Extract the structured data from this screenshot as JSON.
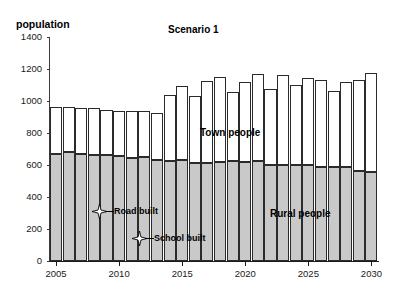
{
  "chart_data": {
    "type": "bar",
    "stacked": true,
    "title": "Scenario 1",
    "xlabel": "",
    "ylabel": "population",
    "ylim": [
      0,
      1400
    ],
    "yticks": [
      0,
      200,
      400,
      600,
      800,
      1000,
      1200,
      1400
    ],
    "xticks": [
      "2005",
      "2010",
      "2015",
      "2020",
      "2025",
      "2030"
    ],
    "grid": false,
    "legend": "in-plot-labels",
    "categories": [
      "2005",
      "2006",
      "2007",
      "2008",
      "2009",
      "2010",
      "2011",
      "2012",
      "2013",
      "2014",
      "2015",
      "2016",
      "2017",
      "2018",
      "2019",
      "2020",
      "2021",
      "2022",
      "2023",
      "2024",
      "2025",
      "2026",
      "2027",
      "2028",
      "2029",
      "2030"
    ],
    "series": [
      {
        "name": "Rural people",
        "color": "#c9c9c9",
        "values": [
          670,
          680,
          670,
          665,
          660,
          655,
          645,
          650,
          630,
          625,
          630,
          610,
          615,
          620,
          625,
          620,
          625,
          600,
          600,
          600,
          600,
          590,
          590,
          585,
          560,
          555
        ]
      },
      {
        "name": "Town people",
        "color": "#ffffff",
        "values": [
          290,
          280,
          285,
          290,
          285,
          280,
          290,
          285,
          295,
          410,
          465,
          420,
          510,
          530,
          430,
          500,
          545,
          475,
          560,
          500,
          545,
          540,
          475,
          535,
          570,
          620
        ]
      }
    ],
    "totals": [
      960,
      960,
      955,
      955,
      945,
      935,
      935,
      935,
      925,
      1035,
      1095,
      1030,
      1125,
      1150,
      1055,
      1120,
      1170,
      1075,
      1160,
      1100,
      1145,
      1130,
      1065,
      1120,
      1130,
      1175
    ],
    "annotations": [
      {
        "label": "Road built",
        "year": "2009",
        "value": 330,
        "marker": "star-4"
      },
      {
        "label": "School built",
        "year": "2012",
        "value": 180,
        "marker": "star-4"
      }
    ]
  },
  "labels": {
    "town_series": "Town people",
    "rural_series": "Rural people",
    "axis_title_y": "population",
    "chart_title": "Scenario 1"
  },
  "caption": ""
}
